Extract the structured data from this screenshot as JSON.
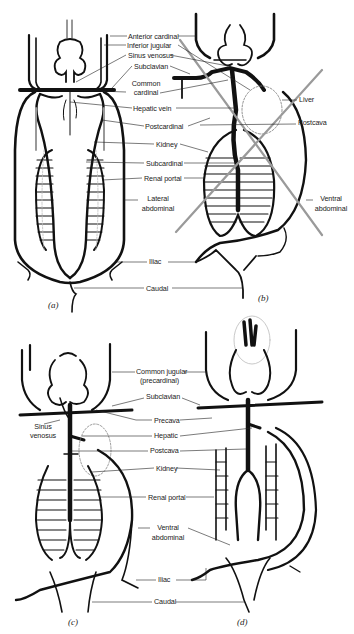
{
  "figure": {
    "panels": [
      {
        "id": "a",
        "caption": "(a)"
      },
      {
        "id": "b",
        "caption": "(b)"
      },
      {
        "id": "c",
        "caption": "(c)"
      },
      {
        "id": "d",
        "caption": "(d)"
      }
    ],
    "top_labels": {
      "anterior_cardinal": "Anterior cardinal",
      "inferior_jugular": "Inferior jugular",
      "sinus_venosus": "Sinus venosus",
      "subclavian": "Subclavian",
      "common_cardinal_1": "Common",
      "common_cardinal_2": "cardinal",
      "hepatic_vein": "Hepatic vein",
      "postcardinal": "Postcardinal",
      "kidney": "Kidney",
      "subcardinal": "Subcardinal",
      "renal_portal": "Renal portal",
      "lateral_abdominal_1": "Lateral",
      "lateral_abdominal_2": "abdominal",
      "iliac": "Iliac",
      "caudal": "Caudal",
      "liver": "Liver",
      "postcava": "Postcava",
      "ventral_abdominal_1": "Ventral",
      "ventral_abdominal_2": "abdominal"
    },
    "bottom_labels": {
      "common_jugular_1": "Common jugular",
      "common_jugular_2": "(precardinal)",
      "subclavian": "Subclavian",
      "sinus_venosus_1": "Sinus",
      "sinus_venosus_2": "venosus",
      "precava": "Precava",
      "hepatic": "Hepatic",
      "postcava": "Postcava",
      "kidney": "Kidney",
      "renal_portal": "Renal portal",
      "ventral_abdominal_1": "Ventral",
      "ventral_abdominal_2": "abdominal",
      "iliac": "Iliac",
      "caudal": "Caudal"
    },
    "colors": {
      "ink": "#111111",
      "crossout": "#9a9a9a",
      "faint": "#c8c8c8"
    }
  }
}
